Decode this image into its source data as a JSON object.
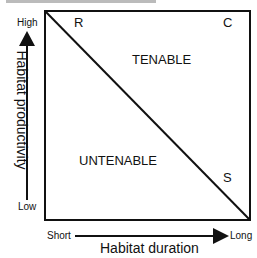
{
  "diagram": {
    "title_cut_off": "",
    "quadrant_corners": {
      "top_left": "R",
      "top_right": "C",
      "bottom_right": "S"
    },
    "regions": {
      "upper": "TENABLE",
      "lower": "UNTENABLE"
    },
    "y_axis": {
      "title": "Habitat productivity",
      "high_label": "High",
      "low_label": "Low"
    },
    "x_axis": {
      "title": "Habitat duration",
      "short_label": "Short",
      "long_label": "Long"
    },
    "colors": {
      "line": "#111111",
      "background": "#ffffff"
    }
  }
}
